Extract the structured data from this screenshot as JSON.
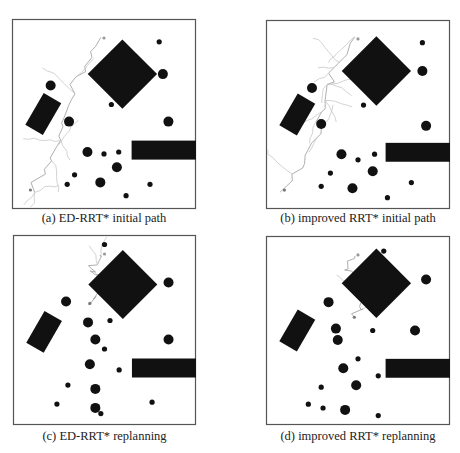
{
  "figure": {
    "colors": {
      "obstacle": "#111111",
      "tree": "#c8c8c8",
      "path": "#9a9a9a",
      "frame": "#555555"
    },
    "panels": [
      {
        "id": "a",
        "caption": "(a) ED-RRT* initial path",
        "tree_density": "medium",
        "obstacles": {
          "diamond": {
            "cx": 60,
            "cy": 29,
            "r": 13
          },
          "rect_tilted": {
            "cx": 17,
            "cy": 50,
            "w": 11,
            "h": 20,
            "angle": 30
          },
          "rect_bar": {
            "x": 65,
            "y": 64,
            "w": 35,
            "h": 10
          },
          "circles": [
            {
              "x": 80,
              "y": 12,
              "r": 1
            },
            {
              "x": 82,
              "y": 29,
              "r": 2
            },
            {
              "x": 21,
              "y": 35,
              "r": 2
            },
            {
              "x": 54,
              "y": 45,
              "r": 1
            },
            {
              "x": 31,
              "y": 54,
              "r": 2
            },
            {
              "x": 85,
              "y": 54,
              "r": 2
            },
            {
              "x": 41,
              "y": 70,
              "r": 2
            },
            {
              "x": 50,
              "y": 71,
              "r": 1
            },
            {
              "x": 58,
              "y": 70,
              "r": 1
            },
            {
              "x": 57,
              "y": 78,
              "r": 2
            },
            {
              "x": 34,
              "y": 82,
              "r": 1
            },
            {
              "x": 48,
              "y": 86,
              "r": 2
            },
            {
              "x": 30,
              "y": 87,
              "r": 1
            },
            {
              "x": 75,
              "y": 87,
              "r": 1
            },
            {
              "x": 62,
              "y": 93,
              "r": 1
            }
          ],
          "start": {
            "x": 10,
            "y": 90
          },
          "goal": {
            "x": 50,
            "y": 10
          }
        }
      },
      {
        "id": "b",
        "caption": "(b) improved RRT* initial path",
        "tree_density": "high",
        "obstacles": {
          "diamond": {
            "cx": 60,
            "cy": 27,
            "r": 13
          },
          "rect_tilted": {
            "cx": 17,
            "cy": 50,
            "w": 11,
            "h": 20,
            "angle": 30
          },
          "rect_bar": {
            "x": 65,
            "y": 65,
            "w": 35,
            "h": 10
          },
          "circles": [
            {
              "x": 85,
              "y": 12,
              "r": 1
            },
            {
              "x": 85,
              "y": 27,
              "r": 2
            },
            {
              "x": 25,
              "y": 36,
              "r": 2
            },
            {
              "x": 53,
              "y": 45,
              "r": 1
            },
            {
              "x": 30,
              "y": 55,
              "r": 2
            },
            {
              "x": 87,
              "y": 56,
              "r": 2
            },
            {
              "x": 41,
              "y": 71,
              "r": 2
            },
            {
              "x": 50,
              "y": 74,
              "r": 1
            },
            {
              "x": 59,
              "y": 71,
              "r": 1
            },
            {
              "x": 58,
              "y": 80,
              "r": 2
            },
            {
              "x": 35,
              "y": 81,
              "r": 1
            },
            {
              "x": 30,
              "y": 88,
              "r": 1
            },
            {
              "x": 47,
              "y": 89,
              "r": 2
            },
            {
              "x": 79,
              "y": 86,
              "r": 1
            },
            {
              "x": 66,
              "y": 94,
              "r": 1
            }
          ],
          "start": {
            "x": 10,
            "y": 90
          },
          "goal": {
            "x": 50,
            "y": 10
          }
        }
      },
      {
        "id": "c",
        "caption": "(c) ED-RRT* replanning",
        "tree_density": "low",
        "obstacles": {
          "diamond": {
            "cx": 60,
            "cy": 26,
            "r": 13
          },
          "rect_tilted": {
            "cx": 17,
            "cy": 51,
            "w": 11,
            "h": 20,
            "angle": 30
          },
          "rect_bar": {
            "x": 65,
            "y": 65,
            "w": 35,
            "h": 10
          },
          "circles": [
            {
              "x": 50,
              "y": 5,
              "r": 1
            },
            {
              "x": 85,
              "y": 25,
              "r": 2
            },
            {
              "x": 29,
              "y": 35,
              "r": 2
            },
            {
              "x": 41,
              "y": 46,
              "r": 2
            },
            {
              "x": 53,
              "y": 45,
              "r": 1
            },
            {
              "x": 45,
              "y": 55,
              "r": 2
            },
            {
              "x": 85,
              "y": 55,
              "r": 2
            },
            {
              "x": 50,
              "y": 60,
              "r": 1
            },
            {
              "x": 42,
              "y": 68,
              "r": 2
            },
            {
              "x": 58,
              "y": 71,
              "r": 1
            },
            {
              "x": 30,
              "y": 79,
              "r": 1
            },
            {
              "x": 45,
              "y": 81,
              "r": 2
            },
            {
              "x": 24,
              "y": 89,
              "r": 1
            },
            {
              "x": 76,
              "y": 88,
              "r": 1
            },
            {
              "x": 45,
              "y": 91,
              "r": 2
            },
            {
              "x": 48,
              "y": 94,
              "r": 1
            }
          ],
          "start": {
            "x": 42,
            "y": 36
          },
          "goal": {
            "x": 50,
            "y": 10
          }
        }
      },
      {
        "id": "d",
        "caption": "(d) improved RRT* replanning",
        "tree_density": "low",
        "obstacles": {
          "diamond": {
            "cx": 60,
            "cy": 25,
            "r": 13
          },
          "rect_tilted": {
            "cx": 17,
            "cy": 50,
            "w": 11,
            "h": 20,
            "angle": 30
          },
          "rect_bar": {
            "x": 65,
            "y": 65,
            "w": 35,
            "h": 10
          },
          "circles": [
            {
              "x": 64,
              "y": 8,
              "r": 1
            },
            {
              "x": 87,
              "y": 23,
              "r": 2
            },
            {
              "x": 34,
              "y": 35,
              "r": 2
            },
            {
              "x": 38,
              "y": 49,
              "r": 2
            },
            {
              "x": 58,
              "y": 50,
              "r": 1
            },
            {
              "x": 81,
              "y": 50,
              "r": 2
            },
            {
              "x": 39,
              "y": 55,
              "r": 2
            },
            {
              "x": 50,
              "y": 65,
              "r": 1
            },
            {
              "x": 42,
              "y": 70,
              "r": 2
            },
            {
              "x": 61,
              "y": 74,
              "r": 1
            },
            {
              "x": 30,
              "y": 80,
              "r": 1
            },
            {
              "x": 49,
              "y": 79,
              "r": 2
            },
            {
              "x": 23,
              "y": 89,
              "r": 1
            },
            {
              "x": 31,
              "y": 91,
              "r": 1
            },
            {
              "x": 43,
              "y": 92,
              "r": 2
            },
            {
              "x": 61,
              "y": 95,
              "r": 1
            }
          ],
          "start": {
            "x": 48,
            "y": 43
          },
          "goal": {
            "x": 50,
            "y": 10
          }
        }
      }
    ]
  }
}
